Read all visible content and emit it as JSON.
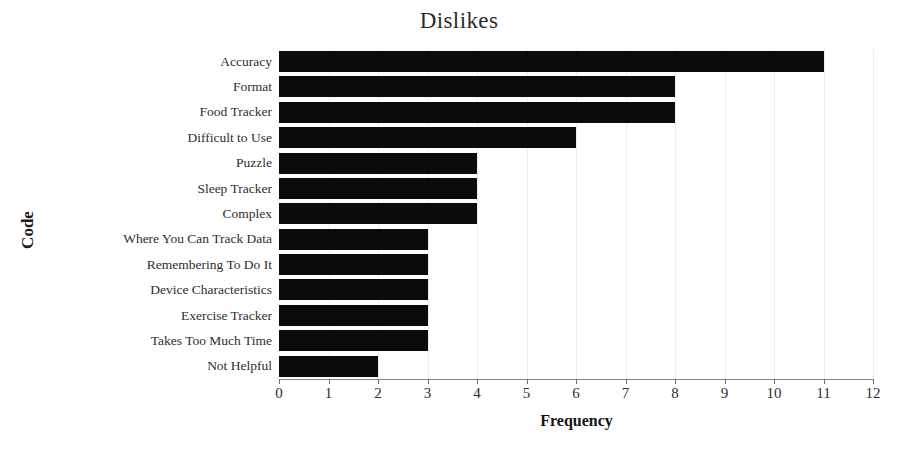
{
  "chart_data": {
    "type": "bar",
    "orientation": "horizontal",
    "title": "Dislikes",
    "xlabel": "Frequency",
    "ylabel": "Code",
    "categories": [
      "Accuracy",
      "Format",
      "Food Tracker",
      "Difficult to Use",
      "Puzzle",
      "Sleep Tracker",
      "Complex",
      "Where You Can Track Data",
      "Remembering To Do It",
      "Device Characteristics",
      "Exercise Tracker",
      "Takes Too Much Time",
      "Not Helpful"
    ],
    "values": [
      11,
      8,
      8,
      6,
      4,
      4,
      4,
      3,
      3,
      3,
      3,
      3,
      2
    ],
    "xlim": [
      0,
      12
    ],
    "xticks": [
      0,
      1,
      2,
      3,
      4,
      5,
      6,
      7,
      8,
      9,
      10,
      11,
      12
    ],
    "xtick_labels": [
      "0",
      "1",
      "2",
      "3",
      "4",
      "5",
      "6",
      "7",
      "8",
      "9",
      "10",
      "11",
      "12"
    ],
    "grid": true,
    "legend": false,
    "bar_color": "#0b0b0b",
    "grid_color": "#ededed",
    "axis_color": "#8a8a8a",
    "background": "#ffffff"
  }
}
